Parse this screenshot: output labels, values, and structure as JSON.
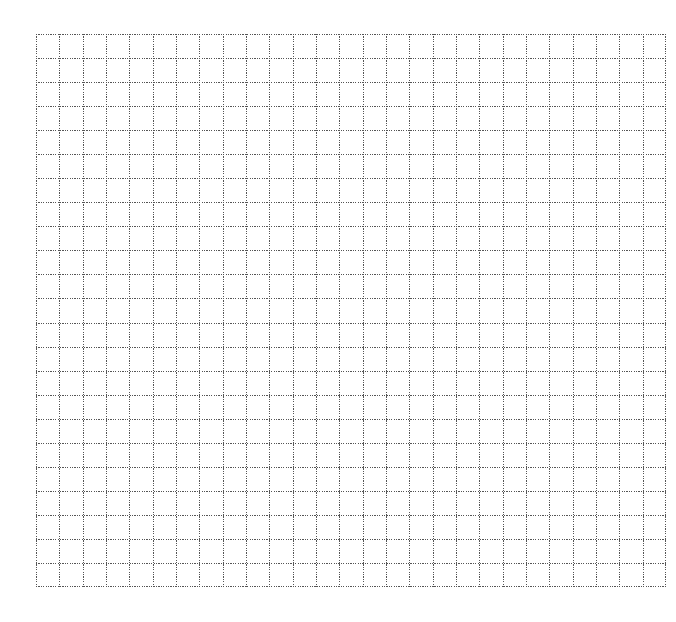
{
  "page": {
    "kind": "blank grid worksheet",
    "background_color": "#ffffff"
  },
  "grid": {
    "columns": 27,
    "rows": 23,
    "line_color": "#555555",
    "line_style": "dotted"
  }
}
